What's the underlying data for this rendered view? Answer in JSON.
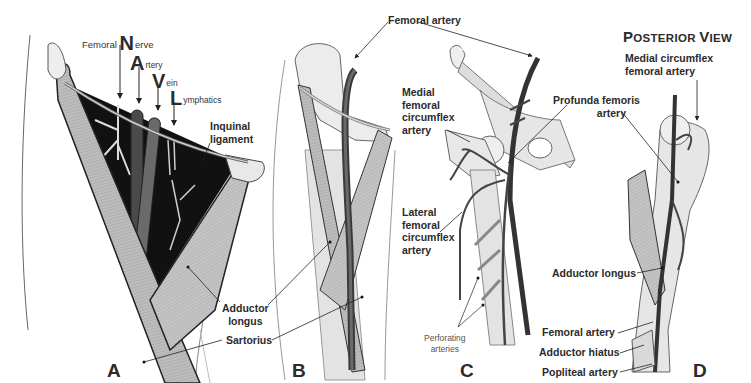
{
  "panels": {
    "A": {
      "letter": "A",
      "mnemonic": [
        {
          "cap": "N",
          "prefix": "Femoral ",
          "rest": "erve"
        },
        {
          "cap": "A",
          "prefix": "",
          "rest": "rtery"
        },
        {
          "cap": "V",
          "prefix": "",
          "rest": "ein"
        },
        {
          "cap": "L",
          "prefix": "",
          "rest": "ymphatics"
        }
      ],
      "labels": {
        "inguinal_1": "Inquinal",
        "inguinal_2": "ligament",
        "adductor_1": "Adductor",
        "adductor_2": "longus",
        "sartorius": "Sartorius"
      }
    },
    "B": {
      "letter": "B",
      "labels": {
        "femoral_artery": "Femoral artery"
      }
    },
    "C": {
      "letter": "C",
      "labels": {
        "medial_1": "Medial",
        "medial_2": "femoral",
        "medial_3": "circumflex",
        "medial_4": "artery",
        "profunda_1": "Profunda femoris",
        "profunda_2": "artery",
        "lateral_1": "Lateral",
        "lateral_2": "femoral",
        "lateral_3": "circumflex",
        "lateral_4": "artery",
        "perforating_1": "Perforating",
        "perforating_2": "arteries"
      }
    },
    "D": {
      "letter": "D",
      "title_cap1": "P",
      "title_rest1": "OSTERIOR ",
      "title_cap2": "V",
      "title_rest2": "IEW",
      "labels": {
        "medial_circ_1": "Medial circumflex",
        "medial_circ_2": "femoral artery",
        "adductor_longus": "Adductor longus",
        "femoral_artery": "Femoral artery",
        "adductor_hiatus": "Adductor hiatus",
        "popliteal_artery": "Popliteal artery"
      }
    }
  },
  "colors": {
    "muscle": "#b9b9b9",
    "muscle_dark": "#8e8e8e",
    "bone": "#e6e6e6",
    "vessel": "#3a3a3a",
    "cavity": "#111111",
    "outline": "#2e2e2e"
  }
}
